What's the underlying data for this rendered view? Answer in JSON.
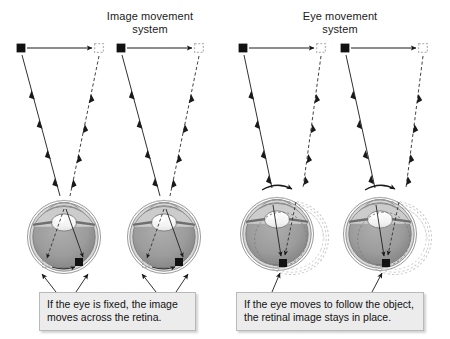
{
  "figure": {
    "background_color": "#ffffff"
  },
  "panels": [
    {
      "id": "image-movement",
      "heading": "Image movement\nsystem",
      "caption": "If the eye is fixed, the image\nmoves across the retina.",
      "eye_count": 2,
      "eye_state": "fixed",
      "retinal_image": "moves across retina"
    },
    {
      "id": "eye-movement",
      "heading": "Eye movement\nsystem",
      "caption": "If the eye moves to follow the object,\nthe retinal image stays in place.",
      "eye_count": 2,
      "eye_state": "rotating to follow object",
      "retinal_image": "stays in place"
    }
  ],
  "legend": {
    "solid_square_meaning": "object at first position",
    "dashed_square_meaning": "object at second position",
    "solid_ray_meaning": "light path from first position",
    "dashed_ray_meaning": "light path from second position",
    "curved_arrow_meaning": "eye rotation direction"
  },
  "colors": {
    "ink": "#1a1a1a",
    "eye_outer": "#b6b6b6",
    "eye_sclera": "#d4d4d4",
    "eye_interior": "#9e9e9e",
    "eye_interior_dark": "#8a8a8a",
    "lens": "#f5f5f5",
    "ghost": "#bfbfbf",
    "caption_bg": "#ececec",
    "caption_border": "#b9b9b9"
  },
  "icons": {
    "object_solid": "filled-square-icon",
    "object_ghost": "dashed-square-icon",
    "ray_arrow": "arrowhead-icon",
    "rotation": "curved-arrow-icon",
    "pointer": "pointer-arrow-icon"
  }
}
